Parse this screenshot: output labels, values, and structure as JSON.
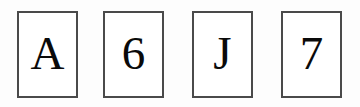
{
  "canvas": {
    "width": 360,
    "height": 107,
    "background_color": "#fdfdfd"
  },
  "style": {
    "card_border_color": "#4a4a4a",
    "card_background_color": "#ffffff",
    "glyph_color": "#0a0a0a"
  },
  "cards": [
    {
      "id": "card-1",
      "label": "A",
      "kind": "letter"
    },
    {
      "id": "card-2",
      "label": "6",
      "kind": "digit"
    },
    {
      "id": "card-3",
      "label": "J",
      "kind": "letter"
    },
    {
      "id": "card-4",
      "label": "7",
      "kind": "digit"
    }
  ]
}
